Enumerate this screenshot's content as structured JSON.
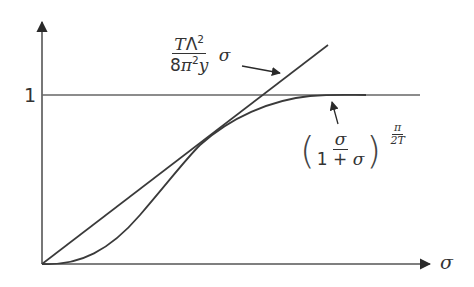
{
  "figure": {
    "type": "function-plot-sketch",
    "axes": {
      "x_label": "σ",
      "y_tick_label": "1"
    },
    "curves": [
      {
        "name": "linear-approximation",
        "formula_numerator_T": "T",
        "formula_numerator_Lambda": "Λ",
        "formula_numerator_exp": "2",
        "formula_denominator_coef": "8",
        "formula_denominator_pi": "π",
        "formula_denominator_exp": "2",
        "formula_denominator_y": "y",
        "formula_suffix": "σ"
      },
      {
        "name": "saturating-curve",
        "frac_numerator": "σ",
        "frac_denominator_one": "1",
        "frac_denominator_plus": " + ",
        "frac_denominator_sigma": "σ",
        "exponent_numerator": "π",
        "exponent_denominator": "2T"
      }
    ],
    "asymptote_label": "1",
    "colors": {
      "line": "#3a3a3a",
      "background": "#ffffff"
    }
  }
}
